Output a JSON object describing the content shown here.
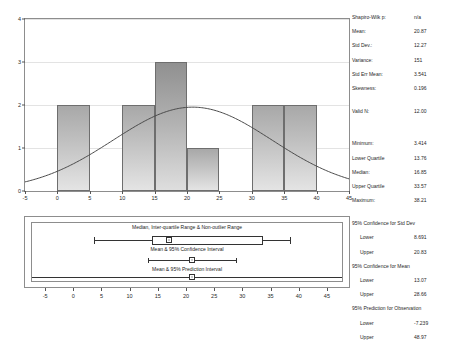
{
  "chart_data": [
    {
      "type": "bar",
      "title": "",
      "xlabel": "",
      "ylabel": "",
      "bin_edges": [
        -5,
        0,
        5,
        10,
        15,
        20,
        25,
        30,
        35,
        40,
        45
      ],
      "categories": [
        "-5 to 0",
        "0 to 5",
        "5 to 10",
        "10 to 15",
        "15 to 20",
        "20 to 25",
        "25 to 30",
        "30 to 35",
        "35 to 40",
        "40 to 45"
      ],
      "values": [
        0,
        2,
        0,
        2,
        3,
        1,
        0,
        2,
        2,
        0
      ],
      "xlim": [
        -5,
        45
      ],
      "ylim": [
        0,
        4
      ],
      "xticks": [
        "-5",
        "0",
        "5",
        "10",
        "15",
        "20",
        "25",
        "30",
        "35",
        "40",
        "45"
      ],
      "yticks": [
        "0",
        "1",
        "2",
        "3",
        "4"
      ],
      "grid": true,
      "overlay": {
        "type": "line",
        "name": "normal-curve",
        "mean": 20.87,
        "std_dev": 12.27,
        "peak_value": 1.95
      }
    },
    {
      "type": "boxplot",
      "xlim": [
        -7.5,
        47.5
      ],
      "xticks": [
        "-5",
        "0",
        "5",
        "10",
        "15",
        "20",
        "25",
        "30",
        "35",
        "40",
        "45"
      ],
      "rows": [
        {
          "label": "Median, Inter-quartile Range & Non-outlier Range",
          "median": 16.85,
          "q1": 13.76,
          "q3": 33.57,
          "whisker_low": 3.414,
          "whisker_high": 38.21,
          "marker": 16.85
        },
        {
          "label": "Mean & 95% Confidence Interval",
          "mean": 20.87,
          "lower": 13.07,
          "upper": 28.66,
          "marker": 20.87
        },
        {
          "label": "Mean & 95% Prediction Interval",
          "mean": 20.87,
          "lower": -7.239,
          "upper": 48.97,
          "marker": 20.87
        }
      ]
    }
  ],
  "stats": {
    "top": [
      {
        "label": "Shapiro-Wilk p:",
        "value": "n/a"
      },
      {
        "label": "Mean:",
        "value": "20.87"
      },
      {
        "label": "Std Dev.:",
        "value": "12.27"
      },
      {
        "label": "Variance:",
        "value": "151"
      },
      {
        "label": "Std Err Mean:",
        "value": "3.541"
      },
      {
        "label": "Skewness:",
        "value": "0.196"
      }
    ],
    "validn": {
      "label": "Valid N:",
      "value": "12.00"
    },
    "quantiles": [
      {
        "label": "Minimum:",
        "value": "3.414"
      },
      {
        "label": "Lower Quartile",
        "value": "13.76"
      },
      {
        "label": "Median:",
        "value": "16.85"
      },
      {
        "label": "Upper Quartile",
        "value": "33.57"
      },
      {
        "label": "Maximum:",
        "value": "38.21"
      }
    ],
    "ci_stddev": {
      "title": "95% Confidence for Std Dev",
      "lower_label": "Lower",
      "lower_value": "8.691",
      "upper_label": "Upper",
      "upper_value": "20.83"
    },
    "ci_mean": {
      "title": "95% Confidence for Mean",
      "lower_label": "Lower",
      "lower_value": "13.07",
      "upper_label": "Upper",
      "upper_value": "28.66"
    },
    "pi_obs": {
      "title": "95% Prediction for Observation",
      "lower_label": "Lower",
      "lower_value": "-7.239",
      "upper_label": "Upper",
      "upper_value": "48.97"
    }
  }
}
